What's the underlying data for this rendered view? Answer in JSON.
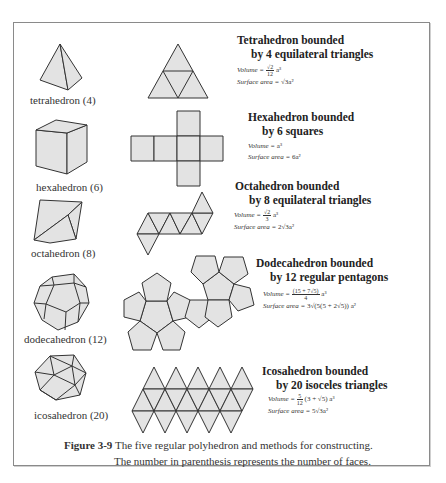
{
  "figure": {
    "caption_label": "Figure 3-9",
    "caption_line1": "The five regular polyhedron and methods for constructing.",
    "caption_line2": "The number in parenthesis represents the number of faces."
  },
  "colors": {
    "face_fill": "#e3e3e3",
    "edge_stroke": "#333333",
    "frame_border": "#8a8a8a"
  },
  "solids": [
    {
      "name": "tetrahedron (4)",
      "title_line1": "Tetrahedron bounded",
      "title_line2": "by 4 equilateral triangles",
      "volume_label": "Volume =",
      "volume_num": "√2",
      "volume_den": "12",
      "volume_tail": "a³",
      "area_label": "Surface area =",
      "area_value": "√3a²"
    },
    {
      "name": "hexahedron (6)",
      "title_line1": "Hexahedron bounded",
      "title_line2": "by 6 squares",
      "volume_label": "Volume =",
      "volume_value": "a³",
      "area_label": "Surface area =",
      "area_value": "6a²"
    },
    {
      "name": "octahedron (8)",
      "title_line1": "Octahedron bounded",
      "title_line2": "by 8 equilateral triangles",
      "volume_label": "Volume =",
      "volume_num": "√2",
      "volume_den": "3",
      "volume_tail": "a³",
      "area_label": "Surface area =",
      "area_value": "2√3a²"
    },
    {
      "name": "dodecahedron (12)",
      "title_line1": "Dodecahedron bounded",
      "title_line2": "by 12 regular pentagons",
      "volume_label": "Volume =",
      "volume_num": "(15 + 7√5)",
      "volume_den": "4",
      "volume_tail": "a³",
      "area_label": "Surface area =",
      "area_value": "3√(5(5 + 2√5)) a²"
    },
    {
      "name": "icosahedron (20)",
      "title_line1": "Icosahedron bounded",
      "title_line2": "by 20 isoceles triangles",
      "volume_label": "Volume =",
      "volume_num": "5",
      "volume_den": "12",
      "volume_tail": "(3 + √5) a³",
      "area_label": "Surface area =",
      "area_value": "5√3a²"
    }
  ]
}
